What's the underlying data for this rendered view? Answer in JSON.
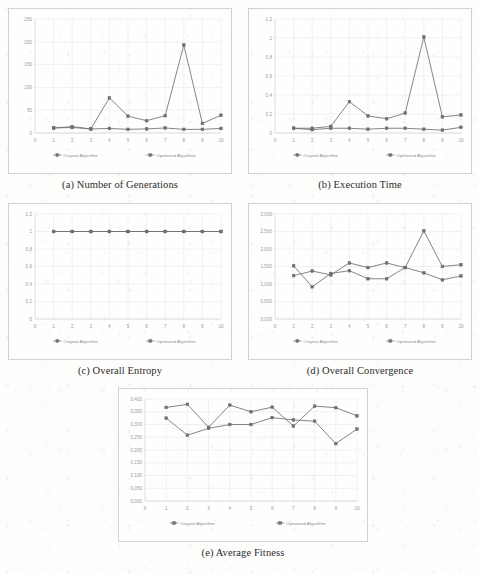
{
  "figure": {
    "series_names": [
      "Original Algorithm",
      "Optimized Algorithm"
    ],
    "series_colors": [
      "#6f6f74",
      "#6f6f74"
    ],
    "x_categories": [
      "1",
      "2",
      "3",
      "4",
      "5",
      "6",
      "7",
      "8",
      "9",
      "10"
    ]
  },
  "panels": [
    {
      "id": "a",
      "caption": "(a) Number of Generations",
      "chart_data": {
        "type": "line",
        "title": "Number of Generations",
        "xlabel": "",
        "ylabel": "",
        "categories": [
          "1",
          "2",
          "3",
          "4",
          "5",
          "6",
          "7",
          "8",
          "9",
          "10"
        ],
        "x_ticks": [
          "0",
          "1",
          "2",
          "3",
          "4",
          "5",
          "6",
          "7",
          "8",
          "9",
          "10"
        ],
        "y_ticks": [
          "0",
          "50",
          "100",
          "150",
          "200",
          "250"
        ],
        "ylim": [
          0,
          250
        ],
        "grid": true,
        "legend_position": "bottom",
        "series": [
          {
            "name": "Original Algorithm",
            "values": [
              11,
              14,
              9,
              77,
              37,
              27,
              38,
              193,
              21,
              39
            ]
          },
          {
            "name": "Optimized Algorithm",
            "values": [
              11,
              12,
              9,
              10,
              8,
              9,
              11,
              8,
              8,
              10
            ]
          }
        ]
      }
    },
    {
      "id": "b",
      "caption": "(b) Execution Time",
      "chart_data": {
        "type": "line",
        "title": "Execution Time",
        "xlabel": "",
        "ylabel": "",
        "categories": [
          "1",
          "2",
          "3",
          "4",
          "5",
          "6",
          "7",
          "8",
          "9",
          "10"
        ],
        "x_ticks": [
          "0",
          "1",
          "2",
          "3",
          "4",
          "5",
          "6",
          "7",
          "8",
          "9",
          "10"
        ],
        "y_ticks": [
          "0",
          "0,2",
          "0,4",
          "0,6",
          "0,8",
          "1",
          "1,2"
        ],
        "ylim": [
          0,
          1.2
        ],
        "grid": true,
        "legend_position": "bottom",
        "series": [
          {
            "name": "Original Algorithm",
            "values": [
              0.05,
              0.05,
              0.07,
              0.33,
              0.18,
              0.15,
              0.21,
              1.01,
              0.17,
              0.19
            ]
          },
          {
            "name": "Optimized Algorithm",
            "values": [
              0.05,
              0.035,
              0.05,
              0.05,
              0.04,
              0.05,
              0.05,
              0.04,
              0.03,
              0.06
            ]
          }
        ]
      }
    },
    {
      "id": "c",
      "caption": "(c) Overall Entropy",
      "chart_data": {
        "type": "line",
        "title": "Overall Entropy",
        "xlabel": "",
        "ylabel": "",
        "categories": [
          "1",
          "2",
          "3",
          "4",
          "5",
          "6",
          "7",
          "8",
          "9",
          "10"
        ],
        "x_ticks": [
          "0",
          "1",
          "2",
          "3",
          "4",
          "5",
          "6",
          "7",
          "8",
          "9",
          "10"
        ],
        "y_ticks": [
          "0",
          "0,2",
          "0,4",
          "0,6",
          "0,8",
          "1",
          "1,2"
        ],
        "ylim": [
          0,
          1.2
        ],
        "grid": true,
        "legend_position": "bottom",
        "series": [
          {
            "name": "Original Algorithm",
            "values": [
              1,
              1,
              1,
              1,
              1,
              1,
              1,
              1,
              1,
              1
            ]
          },
          {
            "name": "Optimized Algorithm",
            "values": [
              1,
              1,
              1,
              1,
              1,
              1,
              1,
              1,
              1,
              1
            ]
          }
        ]
      }
    },
    {
      "id": "d",
      "caption": "(d) Overall Convergence",
      "chart_data": {
        "type": "line",
        "title": "Overall Convergence",
        "xlabel": "",
        "ylabel": "",
        "categories": [
          "1",
          "2",
          "3",
          "4",
          "5",
          "6",
          "7",
          "8",
          "9",
          "10"
        ],
        "x_ticks": [
          "0",
          "1",
          "2",
          "3",
          "4",
          "5",
          "6",
          "7",
          "8",
          "9",
          "10"
        ],
        "y_ticks": [
          "0,000",
          "0,500",
          "1,000",
          "1,500",
          "2,000",
          "2,500",
          "3,000"
        ],
        "ylim": [
          0,
          3.0
        ],
        "grid": true,
        "legend_position": "bottom",
        "series": [
          {
            "name": "Original Algorithm",
            "values": [
              1.52,
              0.92,
              1.3,
              1.38,
              1.15,
              1.15,
              1.47,
              1.32,
              1.12,
              1.23
            ]
          },
          {
            "name": "Optimized Algorithm",
            "values": [
              1.24,
              1.37,
              1.26,
              1.6,
              1.47,
              1.6,
              1.47,
              2.52,
              1.5,
              1.55
            ]
          }
        ]
      }
    },
    {
      "id": "e",
      "caption": "(e) Average Fitness",
      "chart_data": {
        "type": "line",
        "title": "Average Fitness",
        "xlabel": "",
        "ylabel": "",
        "categories": [
          "1",
          "2",
          "3",
          "4",
          "5",
          "6",
          "7",
          "8",
          "9",
          "10"
        ],
        "x_ticks": [
          "0",
          "1",
          "2",
          "3",
          "4",
          "5",
          "6",
          "7",
          "8",
          "9",
          "10"
        ],
        "y_ticks": [
          "0,000",
          "0,050",
          "0,100",
          "0,150",
          "0,200",
          "0,250",
          "0,300",
          "0,350",
          "0,400"
        ],
        "ylim": [
          0,
          0.4
        ],
        "grid": true,
        "legend_position": "bottom",
        "series": [
          {
            "name": "Original Algorithm",
            "values": [
              0.325,
              0.258,
              0.285,
              0.3,
              0.3,
              0.327,
              0.318,
              0.313,
              0.225,
              0.282
            ]
          },
          {
            "name": "Optimized Algorithm",
            "values": [
              0.367,
              0.379,
              0.289,
              0.376,
              0.35,
              0.368,
              0.294,
              0.372,
              0.366,
              0.334
            ]
          }
        ]
      }
    }
  ]
}
